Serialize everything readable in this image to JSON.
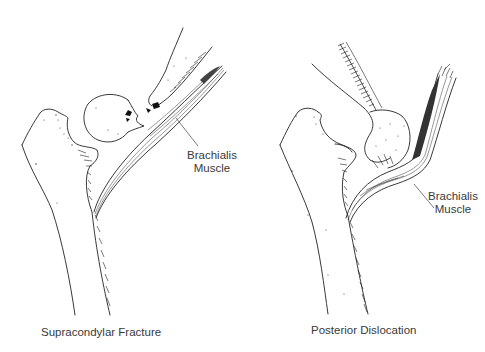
{
  "diagram": {
    "panels": [
      {
        "id": "left",
        "caption": "Supracondylar Fracture",
        "label_line1": "Brachialis",
        "label_line2": "Muscle"
      },
      {
        "id": "right",
        "caption": "Posterior Dislocation",
        "label_line1": "Brachialis",
        "label_line2": "Muscle"
      }
    ],
    "colors": {
      "background": "#ffffff",
      "ink": "#222222",
      "text": "#3a3a3a"
    }
  }
}
